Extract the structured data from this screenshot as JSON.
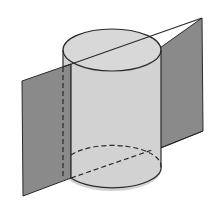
{
  "diagram": {
    "colors": {
      "background": "#ffffff",
      "plane_fill": "#8a8a8a",
      "cylinder_fill": "#d2d2d2",
      "top_fill": "#d8d8d8",
      "stroke": "#2a2a2a"
    },
    "cylinder": {
      "cx": 112,
      "top_cy": 50,
      "bottom_cy": 170,
      "rx": 49,
      "ry": 21
    },
    "plane": {
      "left_panel": [
        [
          22,
          81
        ],
        [
          63,
          67
        ],
        [
          63,
          178
        ],
        [
          23,
          196
        ]
      ],
      "right_panel": [
        [
          162,
          50
        ],
        [
          202,
          18
        ],
        [
          203,
          131
        ],
        [
          162,
          148
        ]
      ]
    }
  }
}
